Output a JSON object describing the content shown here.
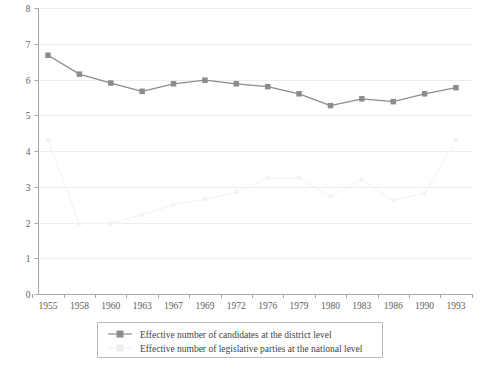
{
  "chart_data": {
    "type": "line",
    "title": "",
    "subtitle": "",
    "xlabel": "",
    "ylabel": "",
    "ylim": [
      0,
      8
    ],
    "y_ticks": [
      0,
      1,
      2,
      3,
      4,
      5,
      6,
      7,
      8
    ],
    "grid": "horizontal",
    "legend_position": "bottom",
    "categories": [
      "1955",
      "1958",
      "1960",
      "1963",
      "1967",
      "1969",
      "1972",
      "1976",
      "1979",
      "1980",
      "1983",
      "1986",
      "1990",
      "1993"
    ],
    "series": [
      {
        "name": "Effective number of candidates at the district level",
        "color": "#8c8c8c",
        "marker": "square",
        "values": [
          6.68,
          6.15,
          5.9,
          5.67,
          5.88,
          5.98,
          5.88,
          5.8,
          5.6,
          5.27,
          5.46,
          5.38,
          5.6,
          5.77
        ]
      },
      {
        "name": "Effective number of legislative parties at the national level",
        "color": "#f2f2f2",
        "marker": "square",
        "values": [
          4.3,
          1.97,
          1.98,
          2.22,
          2.5,
          2.65,
          2.85,
          3.25,
          3.25,
          2.73,
          3.2,
          2.62,
          2.82,
          4.3
        ]
      }
    ]
  },
  "axes": {
    "y_tick_labels": [
      "8",
      "7",
      "6",
      "5",
      "4",
      "3",
      "2",
      "1",
      "0"
    ],
    "x_tick_labels": [
      "1955",
      "1958",
      "1960",
      "1963",
      "1967",
      "1969",
      "1972",
      "1976",
      "1979",
      "1980",
      "1983",
      "1986",
      "1990",
      "1993"
    ]
  },
  "legend": {
    "items": [
      {
        "label": "Effective number of candidates at the district level",
        "marker_color": "#8c8c8c",
        "line_color": "#8c8c8c"
      },
      {
        "label": "Effective number of legislative parties at the national level",
        "marker_color": "#eeeeee",
        "line_color": "#f6f6f6"
      }
    ]
  }
}
